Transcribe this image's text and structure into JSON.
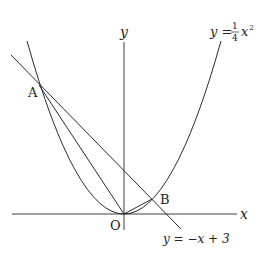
{
  "diagram": {
    "type": "coordinate-plane",
    "axes": {
      "x_label": "x",
      "y_label": "y",
      "origin_label": "O"
    },
    "curves": [
      {
        "name": "parabola",
        "equation_lhs": "y =",
        "equation_coef_num": "1",
        "equation_coef_den": "4",
        "equation_var": "x",
        "equation_exp": "2"
      },
      {
        "name": "line",
        "equation": "y = −x + 3"
      }
    ],
    "points": [
      {
        "label": "A",
        "x": -6,
        "y": 9
      },
      {
        "label": "B",
        "x": 2,
        "y": 1
      }
    ],
    "segments": [
      "OA",
      "OB"
    ],
    "colors": {
      "stroke": "#2a2a2a",
      "background": "#ffffff"
    }
  }
}
